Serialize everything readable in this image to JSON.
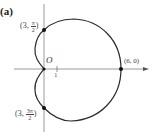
{
  "figure": {
    "panel_label": "(a)",
    "origin_label": "O",
    "tick_label": "1",
    "points": [
      {
        "id": "p_top",
        "label_prefix": "(3, ",
        "frac_num": "π",
        "frac_den": "2",
        "label_suffix": ")",
        "r": 3,
        "theta": "π/2"
      },
      {
        "id": "p_right",
        "label": "(6, 0)",
        "r": 6,
        "theta": "0"
      },
      {
        "id": "p_bottom",
        "label_prefix": "(3, ",
        "frac_num": "3π",
        "frac_den": "2",
        "label_suffix": ")",
        "r": 3,
        "theta": "3π/2"
      }
    ],
    "curve": "cardioid r = 3 + 3cos θ",
    "colors": {
      "curve": "#2a2a2a",
      "axis": "#9a9a9a",
      "point": "#111111"
    }
  }
}
